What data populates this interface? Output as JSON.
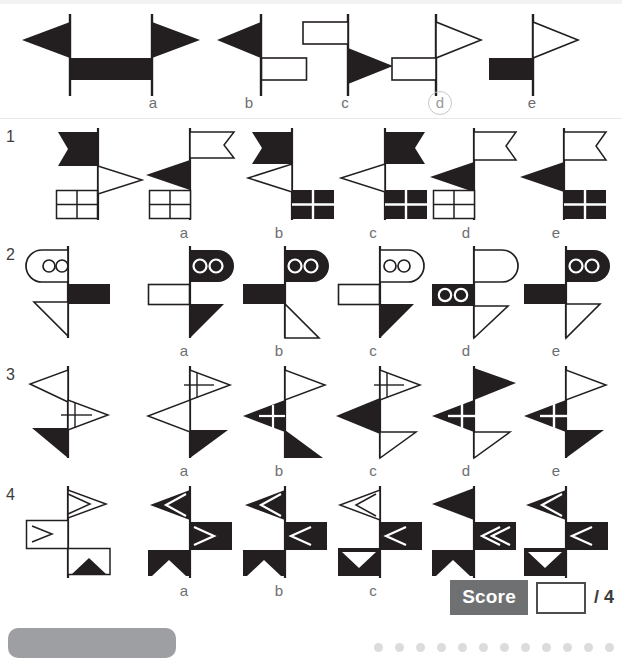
{
  "worksheet": {
    "title": "Signal flag matching puzzle",
    "option_letters": [
      "a",
      "b",
      "c",
      "d",
      "e"
    ],
    "circled_option": "d",
    "row_numbers": [
      "1",
      "2",
      "3",
      "4"
    ]
  },
  "score": {
    "label": "Score",
    "value": "",
    "total": "/ 4"
  },
  "colors": {
    "ink": "#231f20",
    "line": "#3c3c3b",
    "label": "#6d6e71",
    "score_chip_bg": "#6f7072",
    "circle_ring": "#c7c7c7",
    "paper": "#ffffff"
  },
  "rows": [
    {
      "number": "",
      "name": "example-row",
      "prompt_name": "example-prompt-flagpole",
      "prompt_desc": "pole with black left pennant on top and black rectangle right below",
      "options": [
        {
          "letter": "a",
          "desc": "black right pennant top, black rectangle left below"
        },
        {
          "letter": "b",
          "desc": "black left pennant top, white rectangle right below"
        },
        {
          "letter": "c",
          "desc": "white rectangle left top, black right pennant below"
        },
        {
          "letter": "d",
          "desc": "white right pennant top, white rectangle left below"
        },
        {
          "letter": "e",
          "desc": "white right pennant top, black rectangle left below"
        }
      ]
    },
    {
      "number": "1",
      "name": "row-1",
      "prompt_name": "row-1-prompt-flagpole",
      "prompt_desc": "black swallowtail left, white right pennant, white gridded square left",
      "options": [
        {
          "letter": "a",
          "desc": "white swallowtail right, black left pennant, white gridded square"
        },
        {
          "letter": "b",
          "desc": "black swallowtail left, white left pennant, black gridded square right"
        },
        {
          "letter": "c",
          "desc": "black swallowtail right, white left pennant, black gridded square right"
        },
        {
          "letter": "d",
          "desc": "white swallowtail right, black left pennant, white gridded square left"
        },
        {
          "letter": "e",
          "desc": "white swallowtail right, black left pennant, black gridded square right"
        }
      ]
    },
    {
      "number": "2",
      "name": "row-2",
      "prompt_name": "row-2-prompt-flagpole",
      "prompt_desc": "white two-circle rounded flag left, black rectangle right, white triangle left",
      "options": [
        {
          "letter": "a",
          "desc": "black two-circle rounded flag right, white rectangle left, black triangle right"
        },
        {
          "letter": "b",
          "desc": "black two-circle rounded flag right, black rectangle left, white triangle right"
        },
        {
          "letter": "c",
          "desc": "white two-circle rounded flag right, white rectangle left, black triangle right"
        },
        {
          "letter": "d",
          "desc": "white rounded flag right, black two-circle rectangle left, white triangle right"
        },
        {
          "letter": "e",
          "desc": "black two-circle rounded flag right, black rectangle left, white triangle right"
        }
      ]
    },
    {
      "number": "3",
      "name": "row-3-prompt-flagpole",
      "prompt_name": "row-3-prompt-flagpole",
      "prompt_desc": "white left pennant, white right gridded pennant, black left triangle",
      "options": [
        {
          "letter": "a",
          "desc": "white right gridded pennant, white left pennant, black right triangle"
        },
        {
          "letter": "b",
          "desc": "white right pennant, black left gridded pennant, black right triangle"
        },
        {
          "letter": "c",
          "desc": "white right gridded pennant, black left pennant, white right triangle"
        },
        {
          "letter": "d",
          "desc": "black right pennant, black left gridded pennant, white right triangle"
        },
        {
          "letter": "e",
          "desc": "white right pennant, black left gridded pennant, black right triangle"
        }
      ]
    },
    {
      "number": "4",
      "name": "row-4",
      "prompt_name": "row-4-prompt-flagpole",
      "prompt_desc": "white right chevron pennant, white left chevron square, white square with black peak",
      "options": [
        {
          "letter": "a",
          "desc": "black left chevron pennant, black right chevron square, black square with white peak"
        },
        {
          "letter": "b",
          "desc": "black left chevron pennant, black left chevron square, black square with white peak"
        },
        {
          "letter": "c",
          "desc": "white chevron pennant, black left chevron square, black square with white notch"
        },
        {
          "letter": "d",
          "desc": "black left pennant, black double left chevron square, black square with white peak"
        },
        {
          "letter": "e",
          "desc": "black left chevron pennant, black left chevron square, black square with white notch"
        }
      ]
    }
  ]
}
